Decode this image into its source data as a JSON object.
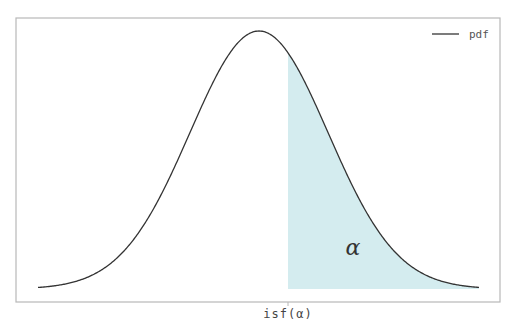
{
  "chart_data": {
    "type": "area",
    "title": "",
    "xlabel": "",
    "ylabel": "",
    "series": [
      {
        "name": "pdf",
        "kind": "line",
        "distribution": "normal",
        "mean": 0,
        "std": 1,
        "x_range": [
          -3.2,
          3.2
        ],
        "color": "#333333"
      }
    ],
    "shaded_region": {
      "from_x": 0.42,
      "to_x": 3.2,
      "under": "pdf",
      "color": "#d4ecef",
      "label": "α"
    },
    "x_ticks": [
      {
        "value": 0.42,
        "label": "isf(α)"
      }
    ],
    "y_ticks": [],
    "grid": false,
    "legend": {
      "position": "upper right",
      "entries": [
        "pdf"
      ]
    },
    "annotations": [
      {
        "text": "α",
        "x": 1.35,
        "y_fraction": 0.16
      }
    ]
  },
  "plot": {
    "frame": {
      "left": 16,
      "top": 18,
      "right": 500,
      "bottom": 302
    },
    "baseline_y": 289,
    "peak_y": 31,
    "center_x": 259,
    "sigma_px": 69,
    "curve_x_start": 38,
    "curve_x_end": 479,
    "shade_start_x": 288,
    "fill_color": "#d4ecef",
    "curve_color": "#333333"
  },
  "legend": {
    "label": "pdf"
  },
  "axis": {
    "x_tick_label": "isf(α)"
  },
  "annotation": {
    "alpha_label": "α"
  }
}
